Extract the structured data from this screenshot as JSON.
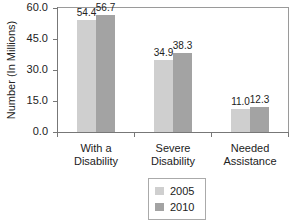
{
  "chart_data": {
    "type": "bar",
    "title": "",
    "xlabel": "",
    "ylabel": "Number (In Millions)",
    "ylim": [
      0,
      60
    ],
    "yticks": [
      "0.0",
      "15.0",
      "30.0",
      "45.0",
      "60.0"
    ],
    "categories": [
      "With a Disability",
      "Severe Disability",
      "Needed Assistance"
    ],
    "category_lines": [
      [
        "With a",
        "Disability"
      ],
      [
        "Severe",
        "Disability"
      ],
      [
        "Needed",
        "Assistance"
      ]
    ],
    "series": [
      {
        "name": "2005",
        "color": "#cfcfcf",
        "values": [
          54.4,
          34.9,
          11.0
        ],
        "labels": [
          "54.4",
          "34.9",
          "11.0"
        ]
      },
      {
        "name": "2010",
        "color": "#a3a3a3",
        "values": [
          56.7,
          38.3,
          12.3
        ],
        "labels": [
          "56.7",
          "38.3",
          "12.3"
        ]
      }
    ],
    "grid": false,
    "legend_position": "bottom-center"
  }
}
